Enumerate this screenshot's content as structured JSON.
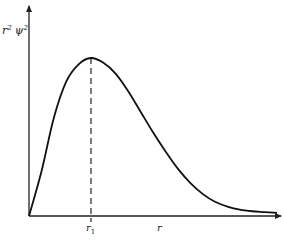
{
  "chart_data": {
    "type": "line",
    "title": "",
    "xlabel": "r",
    "ylabel": "r² ψ²",
    "ylabel_parts": {
      "base1": "r",
      "sup1": "2",
      "base2": "ψ",
      "sup2": "2"
    },
    "xlim": [
      0,
      1
    ],
    "ylim": [
      0,
      1
    ],
    "grid": false,
    "legend": "none",
    "annotations": [
      {
        "type": "vertical-dashed-line",
        "at": "r1",
        "label": "r",
        "label_sub": "1"
      }
    ],
    "series": [
      {
        "name": "radial probability density",
        "x": [
          0,
          0.05,
          0.1,
          0.15,
          0.2,
          0.25,
          0.3,
          0.35,
          0.4,
          0.45,
          0.5,
          0.55,
          0.6,
          0.65,
          0.7,
          0.75,
          0.8,
          0.85,
          0.9,
          0.95,
          1.0
        ],
        "y": [
          0,
          0.28,
          0.62,
          0.85,
          0.96,
          1.0,
          0.97,
          0.9,
          0.79,
          0.66,
          0.53,
          0.41,
          0.3,
          0.21,
          0.14,
          0.09,
          0.06,
          0.04,
          0.03,
          0.025,
          0.02
        ]
      }
    ],
    "r1_x": 0.25
  }
}
